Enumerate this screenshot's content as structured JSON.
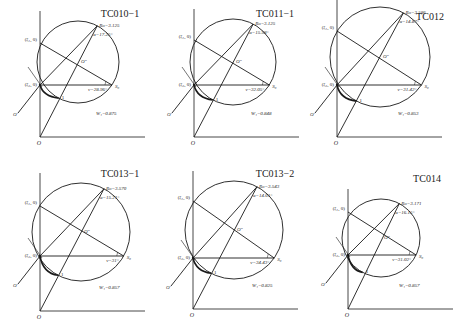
{
  "figure": {
    "stroke_color": "#1a1a1a",
    "background": "#ffffff"
  },
  "panels": [
    {
      "id": "TC010-1",
      "title": "TC010−1",
      "ox": 40,
      "oy": 137,
      "cx": 78,
      "cy": 62,
      "r": 41,
      "xi1_y": 43,
      "xi2_y": 85,
      "ro_label": "Ro=3.125",
      "alpha_label": "α=17.25°",
      "v_label": "v=28.96°",
      "wt_label": "W₁=0.875",
      "xi1_label": "(ξ₁, 0)",
      "xi2_label": "(ξ₂, 0)",
      "o_label": "O",
      "oprime_label": "O′",
      "o2prime_label": "O″",
      "s0_label": "S₀",
      "one_label": "1",
      "title_x": 120,
      "title_y": 17
    },
    {
      "id": "TC011-1",
      "title": "TC011−1",
      "ox": 194,
      "oy": 137,
      "cx": 233,
      "cy": 62,
      "r": 43,
      "xi1_y": 40,
      "xi2_y": 85,
      "ro_label": "Ro=3.125",
      "alpha_label": "α=15.98°",
      "v_label": "v=32.05°",
      "wt_label": "W₁=0.848",
      "xi1_label": "(ξ₁, 0)",
      "xi2_label": "(ξ₂, 0)",
      "o_label": "O",
      "oprime_label": "O′",
      "o2prime_label": "O″",
      "s0_label": "S₀",
      "one_label": "1",
      "title_x": 275,
      "title_y": 17
    },
    {
      "id": "TC012",
      "title": "TC012",
      "ox": 337,
      "oy": 137,
      "cx": 380,
      "cy": 57,
      "r": 50,
      "xi1_y": 31,
      "xi2_y": 85,
      "ro_label": "Ro=3.586",
      "alpha_label": "α=14.87°",
      "v_label": "v=31.42°",
      "wt_label": "W₁=0.853",
      "xi1_label": "(ξ₁, 0)",
      "xi2_label": "(ξ₂, 0)",
      "o_label": "O",
      "oprime_label": "O′",
      "o2prime_label": "O″",
      "s0_label": "S₀",
      "one_label": "1",
      "title_x": 430,
      "title_y": 20
    },
    {
      "id": "TC013-1",
      "title": "TC013−1",
      "ox": 40,
      "oy": 311,
      "cx": 81,
      "cy": 232,
      "r": 49,
      "xi1_y": 206,
      "xi2_y": 256,
      "ro_label": "Ro=3.570",
      "alpha_label": "α=15.21°",
      "v_label": "v=31°",
      "wt_label": "W₁=0.857",
      "xi1_label": "(ξ₁, 0)",
      "xi2_label": "(ξ₂, 0)",
      "o_label": "O",
      "oprime_label": "O′",
      "o2prime_label": "O″",
      "s0_label": "S₀",
      "one_label": "1",
      "title_x": 120,
      "title_y": 177
    },
    {
      "id": "TC013-2",
      "title": "TC013−2",
      "ox": 193,
      "oy": 309,
      "cx": 234,
      "cy": 230,
      "r": 49,
      "xi1_y": 201,
      "xi2_y": 258,
      "ro_label": "Ro=3.543",
      "alpha_label": "α=14.01°",
      "v_label": "v=34.43°",
      "wt_label": "W₁=0.825",
      "xi1_label": "(ξ₁, 0)",
      "xi2_label": "(ξ₂, 0)",
      "o_label": "O",
      "oprime_label": "O′",
      "o2prime_label": "O″",
      "s0_label": "S₀",
      "one_label": "1",
      "title_x": 275,
      "title_y": 177
    },
    {
      "id": "TC014",
      "title": "TC014",
      "ox": 348,
      "oy": 309,
      "cx": 381,
      "cy": 238,
      "r": 39,
      "xi1_y": 212,
      "xi2_y": 255,
      "ro_label": "Ro=3.171",
      "alpha_label": "α=16.15°",
      "v_label": "v=31.02°",
      "wt_label": "W₁=0.857",
      "xi1_label": "(ξ₁, 0)",
      "xi2_label": "(ξ₂, 0)",
      "o_label": "O",
      "oprime_label": "O′",
      "o2prime_label": "O″",
      "s0_label": "S₀",
      "one_label": "1",
      "title_x": 427,
      "title_y": 182
    }
  ]
}
